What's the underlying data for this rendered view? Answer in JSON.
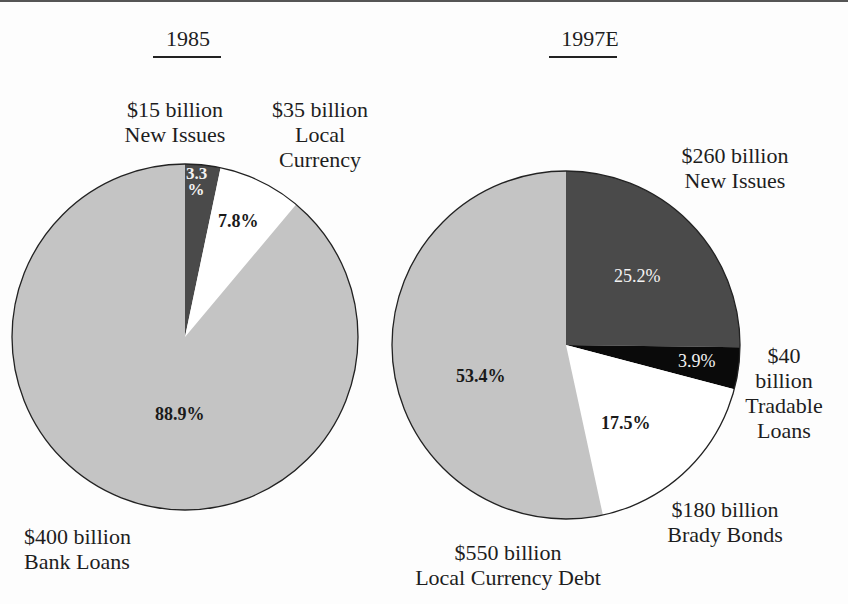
{
  "chart_data": [
    {
      "type": "pie",
      "title": "1985",
      "slices": [
        {
          "label": "New Issues",
          "amount": "$15 billion",
          "value": 3.3,
          "pct_label": "3.3 %",
          "color": "#4a4a4a"
        },
        {
          "label": "Local Currency",
          "amount": "$35 billion",
          "value": 7.8,
          "pct_label": "7.8%",
          "color": "#ffffff"
        },
        {
          "label": "Bank Loans",
          "amount": "$400 billion",
          "value": 88.9,
          "pct_label": "88.9%",
          "color": "#c4c4c4"
        }
      ],
      "start_angle": "12 o'clock, clockwise"
    },
    {
      "type": "pie",
      "title": "1997E",
      "slices": [
        {
          "label": "New Issues",
          "amount": "$260 billion",
          "value": 25.2,
          "pct_label": "25.2%",
          "color": "#4a4a4a"
        },
        {
          "label": "Tradable Loans",
          "amount": "$40 billion",
          "value": 3.9,
          "pct_label": "3.9%",
          "color": "#0a0a0a"
        },
        {
          "label": "Brady Bonds",
          "amount": "$180 billion",
          "value": 17.5,
          "pct_label": "17.5%",
          "color": "#ffffff"
        },
        {
          "label": "Local Currency Debt",
          "amount": "$550 billion",
          "value": 53.4,
          "pct_label": "53.4%",
          "color": "#c4c4c4"
        }
      ],
      "start_angle": "12 o'clock, clockwise"
    }
  ],
  "labels": {
    "p1_title": "1985",
    "p2_title": "1997E",
    "p1_new_issues": {
      "line1": "$15 billion",
      "line2": "New Issues"
    },
    "p1_local": {
      "line1": "$35 billion",
      "line2": "Local",
      "line3": "Currency"
    },
    "p1_bank": {
      "line1": "$400 billion",
      "line2": "Bank Loans"
    },
    "p1_pct_new_top": "3.3",
    "p1_pct_new_bottom": "%",
    "p1_pct_local": "7.8%",
    "p1_pct_bank": "88.9%",
    "p2_new_issues": {
      "line1": "$260 billion",
      "line2": "New Issues"
    },
    "p2_tradable": {
      "line1": "$40",
      "line2": "billion",
      "line3": "Tradable",
      "line4": "Loans"
    },
    "p2_brady": {
      "line1": "$180 billion",
      "line2": "Brady Bonds"
    },
    "p2_local": {
      "line1": "$550 billion",
      "line2": "Local Currency Debt"
    },
    "p2_pct_new": "25.2%",
    "p2_pct_tradable": "3.9%",
    "p2_pct_brady": "17.5%",
    "p2_pct_local": "53.4%"
  }
}
